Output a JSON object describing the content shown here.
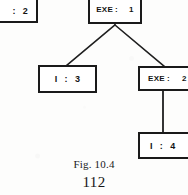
{
  "figure": {
    "caption": "Fig. 10.4",
    "page_number": "112",
    "diagram_type": "tree",
    "nodes": [
      {
        "id": "partial-2",
        "label": "",
        "separator": ":",
        "value": "2",
        "clipped": "left"
      },
      {
        "id": "exe-1",
        "label": "EXE",
        "separator": ":",
        "value": "1",
        "clipped": "none"
      },
      {
        "id": "i-3",
        "label": "I",
        "separator": ":",
        "value": "3",
        "clipped": "none"
      },
      {
        "id": "exe-2",
        "label": "EXE",
        "separator": ":",
        "value": "2",
        "clipped": "right"
      },
      {
        "id": "i-4",
        "label": "I",
        "separator": ":",
        "value": "4",
        "clipped": "right"
      }
    ],
    "edges": [
      {
        "from": "exe-1",
        "to": "i-3",
        "style": "diagonal"
      },
      {
        "from": "exe-1",
        "to": "exe-2",
        "style": "diagonal"
      },
      {
        "from": "exe-2",
        "to": "i-4",
        "style": "vertical"
      }
    ]
  },
  "colors": {
    "ink": "#1a1a1a",
    "paper": "#fdfdfc",
    "box_fill": "#ffffff"
  }
}
